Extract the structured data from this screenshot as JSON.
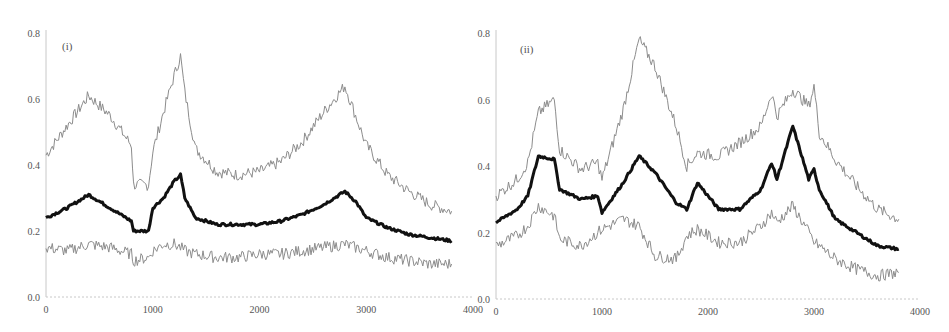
{
  "chart_data": [
    {
      "type": "line",
      "panel_label": "(i)",
      "title": "",
      "xlabel": "",
      "ylabel": "",
      "xlim": [
        0,
        4000
      ],
      "ylim": [
        0.0,
        0.8
      ],
      "xticks": [
        "0",
        "1000",
        "2000",
        "3000",
        "4000"
      ],
      "yticks": [
        "0.0",
        "0.2",
        "0.4",
        "0.6",
        "0.8"
      ],
      "grid": false,
      "legend": null,
      "x": [
        0,
        200,
        400,
        600,
        800,
        820,
        960,
        1000,
        1100,
        1200,
        1260,
        1300,
        1400,
        1600,
        1800,
        2000,
        2200,
        2400,
        2600,
        2800,
        2900,
        3000,
        3200,
        3400,
        3600,
        3800
      ],
      "series": [
        {
          "name": "upper",
          "color": "#8c8c8c",
          "width": 1,
          "values": [
            0.43,
            0.52,
            0.61,
            0.55,
            0.46,
            0.34,
            0.34,
            0.44,
            0.56,
            0.67,
            0.73,
            0.62,
            0.45,
            0.38,
            0.37,
            0.38,
            0.41,
            0.47,
            0.56,
            0.64,
            0.55,
            0.46,
            0.37,
            0.32,
            0.28,
            0.26
          ]
        },
        {
          "name": "mean",
          "color": "#111111",
          "width": 3,
          "values": [
            0.24,
            0.27,
            0.31,
            0.27,
            0.23,
            0.2,
            0.2,
            0.27,
            0.3,
            0.35,
            0.37,
            0.3,
            0.24,
            0.22,
            0.22,
            0.22,
            0.23,
            0.25,
            0.28,
            0.32,
            0.29,
            0.24,
            0.21,
            0.19,
            0.18,
            0.17
          ]
        },
        {
          "name": "lower",
          "color": "#8c8c8c",
          "width": 1,
          "values": [
            0.15,
            0.14,
            0.16,
            0.15,
            0.13,
            0.11,
            0.12,
            0.14,
            0.16,
            0.16,
            0.15,
            0.14,
            0.13,
            0.12,
            0.12,
            0.13,
            0.13,
            0.14,
            0.15,
            0.16,
            0.15,
            0.14,
            0.12,
            0.11,
            0.1,
            0.1
          ]
        }
      ]
    },
    {
      "type": "line",
      "panel_label": "(ii)",
      "title": "",
      "xlabel": "",
      "ylabel": "",
      "xlim": [
        0,
        4000
      ],
      "ylim": [
        0.0,
        0.8
      ],
      "xticks": [
        "0",
        "1000",
        "2000",
        "3000",
        "4000"
      ],
      "yticks": [
        "0.0",
        "0.2",
        "0.4",
        "0.6",
        "0.8"
      ],
      "grid": false,
      "legend": null,
      "x": [
        0,
        200,
        300,
        400,
        550,
        600,
        800,
        960,
        1000,
        1200,
        1350,
        1500,
        1700,
        1800,
        1900,
        2100,
        2300,
        2500,
        2600,
        2650,
        2800,
        2950,
        3000,
        3050,
        3200,
        3400,
        3600,
        3800
      ],
      "series": [
        {
          "name": "upper",
          "color": "#8c8c8c",
          "width": 1,
          "values": [
            0.31,
            0.36,
            0.41,
            0.56,
            0.6,
            0.45,
            0.39,
            0.41,
            0.36,
            0.57,
            0.78,
            0.7,
            0.52,
            0.4,
            0.44,
            0.43,
            0.47,
            0.52,
            0.62,
            0.55,
            0.63,
            0.58,
            0.64,
            0.5,
            0.42,
            0.34,
            0.27,
            0.24
          ]
        },
        {
          "name": "mean",
          "color": "#111111",
          "width": 3,
          "values": [
            0.23,
            0.27,
            0.31,
            0.43,
            0.42,
            0.33,
            0.3,
            0.31,
            0.26,
            0.35,
            0.43,
            0.38,
            0.29,
            0.27,
            0.35,
            0.27,
            0.27,
            0.33,
            0.41,
            0.36,
            0.52,
            0.36,
            0.39,
            0.33,
            0.24,
            0.2,
            0.16,
            0.15
          ]
        },
        {
          "name": "lower",
          "color": "#8c8c8c",
          "width": 1,
          "values": [
            0.16,
            0.19,
            0.22,
            0.28,
            0.25,
            0.18,
            0.16,
            0.2,
            0.21,
            0.24,
            0.22,
            0.13,
            0.12,
            0.19,
            0.21,
            0.17,
            0.17,
            0.22,
            0.26,
            0.23,
            0.28,
            0.2,
            0.17,
            0.16,
            0.12,
            0.09,
            0.07,
            0.08
          ]
        }
      ]
    }
  ]
}
